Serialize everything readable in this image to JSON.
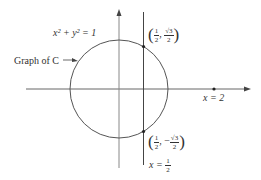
{
  "diagram": {
    "circle_label": "x² + y² = 1",
    "curve_label": "Graph of C",
    "point_top": {
      "x_num": "1",
      "x_den": "2",
      "y_sign": "",
      "y_num": "√3",
      "y_den": "2"
    },
    "point_bottom": {
      "x_num": "1",
      "x_den": "2",
      "y_sign": "−",
      "y_num": "√3",
      "y_den": "2"
    },
    "x2_label": "x = 2",
    "line_label_prefix": "x =",
    "line_label_num": "1",
    "line_label_den": "2",
    "colors": {
      "line": "#555555",
      "text": "#333333"
    }
  }
}
